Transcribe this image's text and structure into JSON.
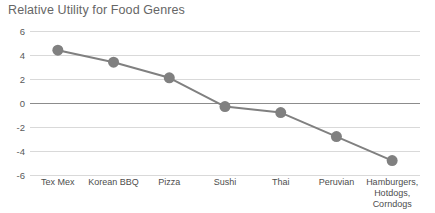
{
  "chart_data": {
    "type": "line",
    "title": "Relative Utility for Food Genres",
    "xlabel": "",
    "ylabel": "",
    "categories": [
      "Tex Mex",
      "Korean BBQ",
      "Pizza",
      "Sushi",
      "Thai",
      "Peruvian",
      "Hamburgers,\nHotdogs,\nCorndogs"
    ],
    "values": [
      4.4,
      3.4,
      2.1,
      -0.3,
      -0.8,
      -2.8,
      -4.8
    ],
    "ylim": [
      -6,
      6
    ],
    "yticks": [
      6,
      4,
      2,
      0,
      -2,
      -4,
      -6
    ],
    "ytick_labels": [
      "6",
      "4",
      "2",
      "0",
      "-2",
      "-4",
      "-6"
    ],
    "grid": true,
    "legend": false,
    "series_color": "#808080",
    "marker_color": "#808080",
    "gridline_color": "#d9d9d9",
    "zero_line_color": "#8c8c8c",
    "title_color": "#666666",
    "marker_radius": 5.5,
    "line_width": 2
  }
}
